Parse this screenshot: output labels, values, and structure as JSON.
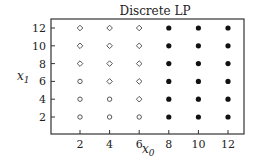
{
  "chart_data": {
    "type": "scatter",
    "title": "Discrete LP",
    "xlabel": "x0",
    "ylabel": "x1",
    "xlim": [
      0,
      13
    ],
    "ylim": [
      0,
      13
    ],
    "xticks": [
      2,
      4,
      6,
      8,
      10,
      12
    ],
    "yticks": [
      2,
      4,
      6,
      8,
      10,
      12
    ],
    "grid": false,
    "legend": null,
    "series": [
      {
        "name": "open-circle",
        "marker": "circle-open",
        "points": [
          [
            2,
            2
          ],
          [
            4,
            2
          ],
          [
            6,
            2
          ],
          [
            2,
            4
          ],
          [
            4,
            4
          ],
          [
            2,
            6
          ]
        ]
      },
      {
        "name": "open-diamond",
        "marker": "diamond-open",
        "points": [
          [
            6,
            4
          ],
          [
            4,
            6
          ],
          [
            6,
            6
          ],
          [
            2,
            8
          ],
          [
            4,
            8
          ],
          [
            6,
            8
          ],
          [
            2,
            10
          ],
          [
            4,
            10
          ],
          [
            6,
            10
          ],
          [
            2,
            12
          ],
          [
            4,
            12
          ],
          [
            6,
            12
          ]
        ]
      },
      {
        "name": "filled-circle",
        "marker": "circle-filled",
        "points": [
          [
            8,
            2
          ],
          [
            10,
            2
          ],
          [
            12,
            2
          ],
          [
            8,
            4
          ],
          [
            10,
            4
          ],
          [
            12,
            4
          ],
          [
            8,
            6
          ],
          [
            10,
            6
          ],
          [
            12,
            6
          ],
          [
            8,
            8
          ],
          [
            10,
            8
          ],
          [
            12,
            8
          ],
          [
            8,
            10
          ],
          [
            10,
            10
          ],
          [
            12,
            10
          ],
          [
            8,
            12
          ],
          [
            10,
            12
          ],
          [
            12,
            12
          ]
        ]
      }
    ]
  },
  "labels": {
    "title": "Discrete LP",
    "xlabel_base": "x",
    "xlabel_sub": "0",
    "ylabel_base": "x",
    "ylabel_sub": "1"
  }
}
